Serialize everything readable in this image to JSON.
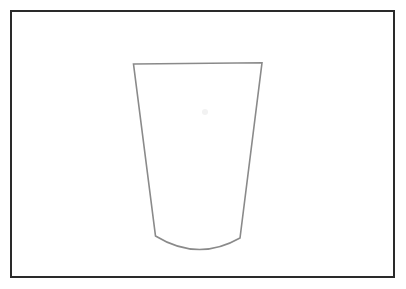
{
  "canvas": {
    "width": 406,
    "height": 289,
    "background_color": "#ffffff",
    "title": "Line drawing of a tapered cup"
  },
  "frame": {
    "name": "border-rectangle",
    "x": 11,
    "y": 11,
    "width": 383,
    "height": 266,
    "stroke_color": "#2a2a2a",
    "stroke_width": 1.6,
    "fill": "none"
  },
  "drawing": {
    "subject": "cup",
    "description": "Outline of a tapered drinking cup / tumbler, wide at the rim and narrower at the rounded base",
    "stroke_color": "#8a8a8a",
    "stroke_width": 1.6,
    "fill": "none",
    "parts": [
      {
        "name": "cup-rim",
        "type": "line",
        "points": [
          [
            133.5,
            64.0
          ],
          [
            262.0,
            62.8
          ]
        ]
      },
      {
        "name": "cup-left-wall",
        "type": "line",
        "points": [
          [
            133.5,
            64.0
          ],
          [
            155.5,
            236.0
          ]
        ]
      },
      {
        "name": "cup-right-wall",
        "type": "line",
        "points": [
          [
            262.0,
            62.8
          ],
          [
            240.0,
            238.0
          ]
        ]
      },
      {
        "name": "cup-base-curve",
        "type": "arc",
        "start": [
          155.5,
          236.0
        ],
        "control": [
          198.0,
          262.0
        ],
        "end": [
          240.0,
          238.0
        ],
        "lowest_point_y": 251
      }
    ],
    "path_d": "M 133.5 64.0 L 262.0 62.8 L 240.0 238.0 Q 198.0 262.0 155.5 236.0 Z"
  },
  "artifact": {
    "name": "scan-speck",
    "x": 205,
    "y": 112,
    "color": "#f2f2f2",
    "visible": true
  }
}
